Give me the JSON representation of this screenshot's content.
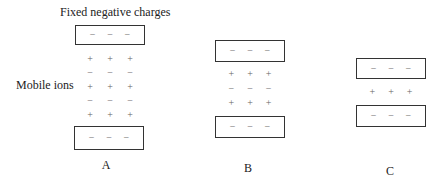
{
  "labels": {
    "fixed": "Fixed negative charges",
    "mobile": "Mobile ions"
  },
  "symbols": {
    "neg": "−",
    "pos": "+"
  },
  "panels": [
    {
      "name": "A",
      "fixed_top": [
        "−",
        "−",
        "−"
      ],
      "fixed_bottom": [
        "−",
        "−",
        "−"
      ],
      "ion_rows": [
        [
          "+",
          "+",
          "+"
        ],
        [
          "−",
          "−",
          "−"
        ],
        [
          "+",
          "+",
          "+"
        ],
        [
          "−",
          "−",
          "−"
        ],
        [
          "+",
          "+",
          "+"
        ]
      ]
    },
    {
      "name": "B",
      "fixed_top": [
        "−",
        "−",
        "−"
      ],
      "fixed_bottom": [
        "−",
        "−",
        "−"
      ],
      "ion_rows": [
        [
          "+",
          "+",
          "+"
        ],
        [
          "−",
          "−",
          "−"
        ],
        [
          "+",
          "+",
          "+"
        ]
      ]
    },
    {
      "name": "C",
      "fixed_top": [
        "−",
        "−",
        "−"
      ],
      "fixed_bottom": [
        "−",
        "−",
        "−"
      ],
      "ion_rows": [
        [
          "+",
          "+",
          "+"
        ]
      ]
    }
  ]
}
